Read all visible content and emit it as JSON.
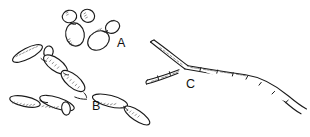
{
  "figure": {
    "background_color": "#ffffff",
    "ink_color": "#1a1a1a",
    "width": 310,
    "height": 137,
    "panels": [
      {
        "id": "A",
        "label": "A",
        "label_x": 117,
        "label_y": 47,
        "description": "Budding yeast cells (blastoconidia) with attached buds"
      },
      {
        "id": "B",
        "label": "B",
        "label_x": 92,
        "label_y": 110,
        "description": "Pseudohyphae: chains of elongated cells constricted at septa"
      },
      {
        "id": "C",
        "label": "C",
        "label_x": 186,
        "label_y": 88,
        "description": "True septate hyphae with parallel walls and branching"
      }
    ]
  }
}
